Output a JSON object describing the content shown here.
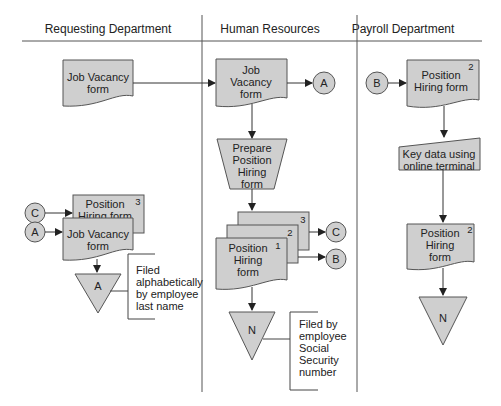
{
  "lanes": [
    {
      "title": "Requesting Department"
    },
    {
      "title": "Human Resources"
    },
    {
      "title": "Payroll Department"
    }
  ],
  "requesting": {
    "doc_jv_top": {
      "line1": "Job Vacancy",
      "line2": "form"
    },
    "conn_c": "C",
    "doc_ph": {
      "line1": "Position",
      "line2": "Hiring form",
      "copy": "3"
    },
    "conn_a": "A",
    "doc_jv_bottom": {
      "line1": "Job Vacancy",
      "line2": "form"
    },
    "file": "A",
    "annotation": [
      "Filed",
      "alphabetically",
      "by employee",
      "last name"
    ]
  },
  "hr": {
    "doc_jv": {
      "line1": "Job",
      "line2": "Vacancy",
      "line3": "form"
    },
    "conn_a": "A",
    "manual_op": {
      "line1": "Prepare",
      "line2": "Position",
      "line3": "Hiring",
      "line4": "form"
    },
    "copies": [
      "3",
      "2",
      "1"
    ],
    "doc_ph": {
      "line1": "Position",
      "line2": "Hiring",
      "line3": "form"
    },
    "conn_c": "C",
    "conn_b": "B",
    "file": "N",
    "annotation": [
      "Filed by",
      "employee",
      "Social",
      "Security",
      "number"
    ]
  },
  "payroll": {
    "conn_b": "B",
    "doc_ph_top": {
      "line1": "Position",
      "line2": "Hiring form",
      "copy": "2"
    },
    "manual_input": {
      "line1": "Key data using",
      "line2": "online terminal"
    },
    "doc_ph_bottom": {
      "line1": "Position",
      "line2": "Hiring",
      "line3": "form",
      "copy": "2"
    },
    "file": "N"
  }
}
